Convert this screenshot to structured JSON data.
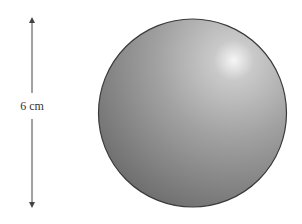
{
  "diagram": {
    "type": "sphere-with-dimension",
    "dimension_label": "6 cm",
    "colors": {
      "sphere_light": "#f4f4f4",
      "sphere_mid": "#9a9a9a",
      "sphere_dark": "#6e6e6e",
      "outline": "#3a3a3a",
      "arrow": "#444444"
    }
  }
}
